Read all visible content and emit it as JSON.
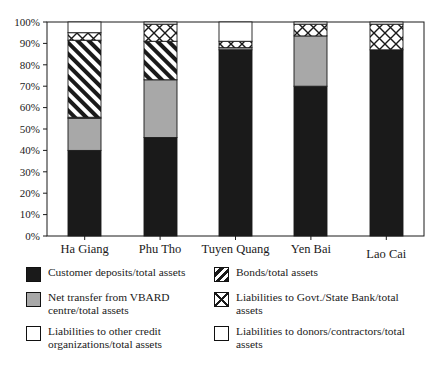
{
  "chart_data": {
    "type": "bar",
    "subtype": "stacked-100-percent",
    "title": "",
    "xlabel": "",
    "ylabel": "",
    "ylim": [
      0,
      100
    ],
    "ytick_labels": [
      "0%",
      "10%",
      "20%",
      "30%",
      "40%",
      "50%",
      "60%",
      "70%",
      "80%",
      "90%",
      "100%"
    ],
    "ytick_values": [
      0,
      10,
      20,
      30,
      40,
      50,
      60,
      70,
      80,
      90,
      100
    ],
    "grid": false,
    "legend_position": "below",
    "categories": [
      "Ha Giang",
      "Phu Tho",
      "Tuyen Quang",
      "Yen Bai",
      "Lao Cai"
    ],
    "series": [
      {
        "name": "Customer deposits/total assets",
        "pattern": "solid-black",
        "color": "#1a1a1a",
        "values": [
          40,
          46,
          87,
          70,
          87
        ]
      },
      {
        "name": "Net transfer from VBARD centre/total assets",
        "pattern": "solid-gray",
        "color": "#a8a8a8",
        "values": [
          15,
          27,
          1,
          23.5,
          0
        ]
      },
      {
        "name": "Liabilities to other credit organizations/total assets",
        "pattern": "open-white",
        "color": "#ffffff",
        "values": [
          0.5,
          0,
          0,
          0,
          0
        ]
      },
      {
        "name": "Bonds/total assets",
        "pattern": "diagonal-stripes",
        "color": "#1a1a1a",
        "values": [
          36,
          18,
          0,
          0,
          0
        ]
      },
      {
        "name": "Liabilities to Govt./State Bank/total assets",
        "pattern": "cross-hatch",
        "color": "#1a1a1a",
        "values": [
          3.5,
          8,
          3,
          5.5,
          12
        ]
      },
      {
        "name": "Liabilities to donors/contractors/total assets",
        "pattern": "open-white",
        "color": "#ffffff",
        "values": [
          5,
          1,
          9,
          1,
          1
        ]
      }
    ]
  },
  "legend": {
    "entries": [
      {
        "pattern": "solid-black",
        "label": "Customer deposits/total assets"
      },
      {
        "pattern": "diagonal-stripes",
        "label": "Bonds/total assets"
      },
      {
        "pattern": "solid-gray",
        "label": "Net transfer from VBARD centre/total assets"
      },
      {
        "pattern": "cross-hatch",
        "label": "Liabilities to Govt./State Bank/total assets"
      },
      {
        "pattern": "open-white",
        "label": "Liabilities to other credit organizations/total assets"
      },
      {
        "pattern": "open-white",
        "label": "Liabilities to donors/contractors/total assets"
      }
    ]
  },
  "colors": {
    "black": "#1a1a1a",
    "gray": "#a8a8a8",
    "white": "#ffffff",
    "axis": "#1a1a1a"
  }
}
